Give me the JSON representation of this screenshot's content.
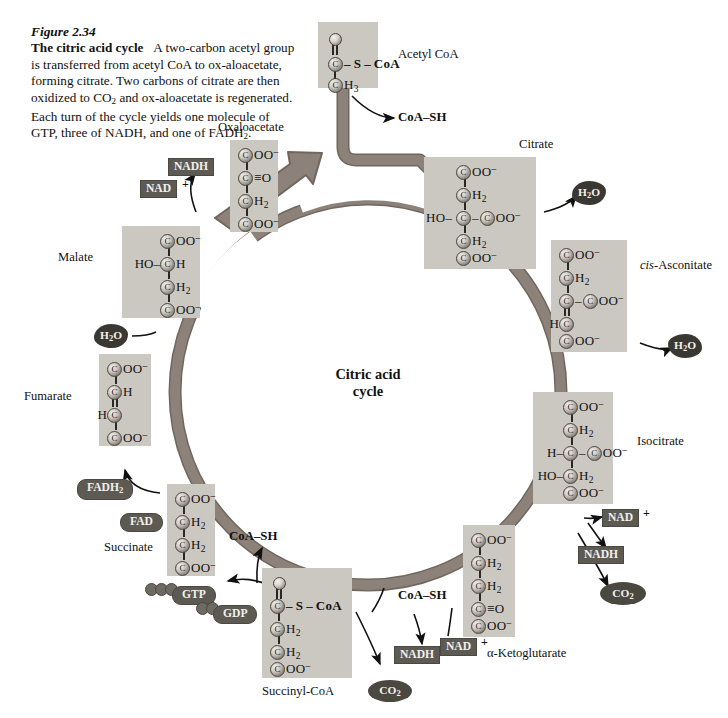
{
  "figure": {
    "number": "Figure 2.34",
    "lead": "The citric acid cycle",
    "body": "A two-carbon acetyl group is transferred from acetyl CoA to oxaloacetate, forming citrate. Two carbons of citrate are then oxidized to CO2 and oxaloacetate is regenerated. Each turn of the cycle yields one molecule of GTP, three of NADH, and one of FADH2."
  },
  "center_label": {
    "line1": "Citric acid",
    "line2": "cycle"
  },
  "colors": {
    "ribbon": "#8c8279",
    "ribbon_edge": "#6f675f",
    "molecule_box": "#cbc8c2",
    "chip_bg": "#5d5a54",
    "chip_text": "#f2f0ec",
    "bond": "#2b2822",
    "text": "#111111",
    "page_bg": "#ffffff"
  },
  "molecules": [
    {
      "id": "acetyl-coa",
      "label": "Acetyl CoA",
      "rows": [
        {
          "left": "",
          "atom": "O",
          "right": "",
          "kind": "oxygen"
        },
        {
          "left": "",
          "atom": "C",
          "right": "— S — CoA"
        },
        {
          "left": "",
          "atom": "C",
          "right": "H3"
        }
      ]
    },
    {
      "id": "oxaloacetate",
      "label": "Oxaloacetate",
      "rows": [
        {
          "left": "",
          "atom": "C",
          "right": "OO-"
        },
        {
          "left": "",
          "atom": "C",
          "right": "= O"
        },
        {
          "left": "",
          "atom": "C",
          "right": "H2"
        },
        {
          "left": "",
          "atom": "C",
          "right": "OO-"
        }
      ]
    },
    {
      "id": "citrate",
      "label": "Citrate",
      "rows": [
        {
          "left": "",
          "atom": "C",
          "right": "OO-"
        },
        {
          "left": "",
          "atom": "C",
          "right": "H2"
        },
        {
          "left": "HO —",
          "atom": "C",
          "right": "— C OO-"
        },
        {
          "left": "",
          "atom": "C",
          "right": "H2"
        },
        {
          "left": "",
          "atom": "C",
          "right": "OO-"
        }
      ]
    },
    {
      "id": "cis-aconitate",
      "label": "cis-Asconitate",
      "label_italic_part": "cis",
      "rows": [
        {
          "left": "",
          "atom": "C",
          "right": "OO-"
        },
        {
          "left": "",
          "atom": "C",
          "right": "H2"
        },
        {
          "left": "",
          "atom": "C",
          "right": "— C OO-"
        },
        {
          "left": "H",
          "atom": "C",
          "right": ""
        },
        {
          "left": "",
          "atom": "C",
          "right": "OO-"
        }
      ]
    },
    {
      "id": "isocitrate",
      "label": "Isocitrate",
      "rows": [
        {
          "left": "",
          "atom": "C",
          "right": "OO-"
        },
        {
          "left": "",
          "atom": "C",
          "right": "H2"
        },
        {
          "left": "H —",
          "atom": "C",
          "right": "— C OO-"
        },
        {
          "left": "HO —",
          "atom": "C",
          "right": "H2"
        },
        {
          "left": "",
          "atom": "C",
          "right": "OO-"
        }
      ]
    },
    {
      "id": "alpha-ketoglutarate",
      "label": "α-Ketoglutarate",
      "rows": [
        {
          "left": "",
          "atom": "C",
          "right": "OO-"
        },
        {
          "left": "",
          "atom": "C",
          "right": "H2"
        },
        {
          "left": "",
          "atom": "C",
          "right": "H2"
        },
        {
          "left": "",
          "atom": "C",
          "right": "= O"
        },
        {
          "left": "",
          "atom": "C",
          "right": "OO-"
        }
      ]
    },
    {
      "id": "succinyl-coa",
      "label": "Succinyl-CoA",
      "rows": [
        {
          "left": "",
          "atom": "O",
          "right": "",
          "kind": "oxygen"
        },
        {
          "left": "",
          "atom": "C",
          "right": "— S — CoA"
        },
        {
          "left": "",
          "atom": "C",
          "right": "H2"
        },
        {
          "left": "",
          "atom": "C",
          "right": "H2"
        },
        {
          "left": "",
          "atom": "C",
          "right": "OO-"
        }
      ]
    },
    {
      "id": "succinate",
      "label": "Succinate",
      "rows": [
        {
          "left": "",
          "atom": "C",
          "right": "OO-"
        },
        {
          "left": "",
          "atom": "C",
          "right": "H2"
        },
        {
          "left": "",
          "atom": "C",
          "right": "H2"
        },
        {
          "left": "",
          "atom": "C",
          "right": "OO-"
        }
      ]
    },
    {
      "id": "fumarate",
      "label": "Fumarate",
      "rows": [
        {
          "left": "",
          "atom": "C",
          "right": "OO-"
        },
        {
          "left": "",
          "atom": "C",
          "right": "H"
        },
        {
          "left": "H",
          "atom": "C",
          "right": ""
        },
        {
          "left": "",
          "atom": "C",
          "right": "OO-"
        }
      ]
    },
    {
      "id": "malate",
      "label": "Malate",
      "rows": [
        {
          "left": "",
          "atom": "C",
          "right": "OO-"
        },
        {
          "left": "HO —",
          "atom": "C",
          "right": "H"
        },
        {
          "left": "",
          "atom": "C",
          "right": "H2"
        },
        {
          "left": "",
          "atom": "C",
          "right": "OO-"
        }
      ]
    }
  ],
  "cofactors": {
    "nadh_malate": "NADH",
    "nad_malate": "NAD",
    "nad_malate_plus": "+",
    "h2o_fumarate": "H2O",
    "fadh2": "FADH2",
    "fad": "FAD",
    "gtp": "GTP",
    "gdp": "GDP",
    "coash_succinate": "CoA–SH",
    "coash_succinyl": "CoA–SH",
    "coash_acetyl": "CoA–SH",
    "co2_succinyl": "CO2",
    "nadh_succinyl": "NADH",
    "nad_succinyl": "NAD",
    "nad_succinyl_plus": "+",
    "nad_ketoglutarate": "NAD",
    "nad_ketoglutarate_plus": "+",
    "nadh_ketoglutarate": "NADH",
    "co2_ketoglutarate": "CO2",
    "h2o_isocitrate": "H2O",
    "h2o_citrate": "H2O"
  }
}
